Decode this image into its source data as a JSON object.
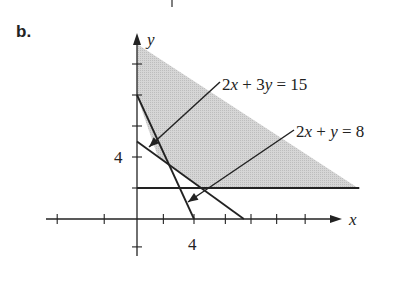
{
  "part_label": "b.",
  "colors": {
    "ink": "#222222",
    "shade": "#cfcfcf"
  },
  "axes": {
    "x_label": "x",
    "y_label": "y",
    "x_tick_label": "4",
    "y_tick_label": "4",
    "origin_px": [
      137,
      219
    ],
    "px_per_unit_x": 14.25,
    "px_per_unit_y": 15.5,
    "x_ticks_units": [
      -5.6,
      -2.3,
      1.85,
      4,
      6.2,
      8.0,
      9.8,
      11.8
    ],
    "y_ticks_units": [
      -1.8,
      2,
      4,
      6,
      8,
      10
    ],
    "x_range_px": [
      46,
      342
    ],
    "y_range_px": [
      228,
      33
    ]
  },
  "lines": [
    {
      "name": "2x + 3y = 15",
      "label": "2x + 3y = 15",
      "from": [
        0,
        5
      ],
      "to": [
        7.5,
        0
      ]
    },
    {
      "name": "2x + y = 8",
      "label": "2x + y = 8",
      "from": [
        0,
        8
      ],
      "to": [
        4,
        0
      ]
    },
    {
      "name": "y = 2",
      "label": "",
      "from": [
        0,
        2
      ],
      "to": [
        15.6,
        2
      ]
    }
  ],
  "chart_data": {
    "type": "line",
    "title": "b.",
    "xlabel": "x",
    "ylabel": "y",
    "tick_labels": {
      "x": [
        "4"
      ],
      "y": [
        "4"
      ]
    },
    "series": [
      {
        "name": "2x + 3y = 15",
        "points": [
          [
            0,
            5
          ],
          [
            7.5,
            0
          ]
        ]
      },
      {
        "name": "2x + y = 8",
        "points": [
          [
            0,
            8
          ],
          [
            4,
            0
          ]
        ]
      },
      {
        "name": "y = 2",
        "points": [
          [
            0,
            2
          ],
          [
            15.6,
            2
          ]
        ]
      }
    ],
    "shaded_region": {
      "description": "Unbounded feasible region above y = 2, above 2x + y = 8 and above 2x + 3y = 15, bounded on the left by x = 0",
      "vertices": [
        [
          0,
          11.3
        ],
        [
          0,
          8
        ],
        [
          1.5,
          4
        ],
        [
          4.5,
          2
        ],
        [
          15.6,
          2
        ]
      ]
    },
    "annotations": [
      {
        "text": "2x + 3y = 15",
        "arrow_to": [
          0.9,
          4.7
        ]
      },
      {
        "text": "2x + y = 8",
        "arrow_to": [
          3.6,
          1.1
        ]
      }
    ],
    "xlim": [
      -6.4,
      14.4
    ],
    "ylim": [
      -0.6,
      12.6
    ],
    "grid": false
  },
  "annotations": [
    {
      "text": "2x + 3y = 15",
      "text_px": [
        222,
        90
      ],
      "arrow_from_px": [
        220,
        82
      ],
      "arrow_to_px": [
        149,
        147
      ]
    },
    {
      "text": "2x + y = 8",
      "text_px": [
        296,
        137
      ],
      "arrow_from_px": [
        294,
        130
      ],
      "arrow_to_px": [
        188,
        202
      ]
    }
  ],
  "shaded_polygon_px": [
    [
      137,
      44
    ],
    [
      137,
      96
    ],
    [
      158,
      157
    ],
    [
      201,
      188
    ],
    [
      358,
      188
    ]
  ],
  "top_mark_px": [
    172,
    0,
    172,
    7
  ]
}
